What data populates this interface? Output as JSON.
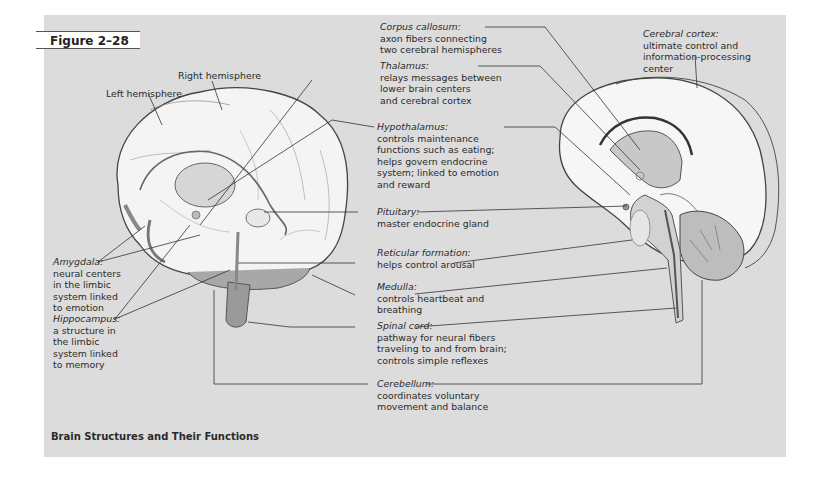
{
  "figure": {
    "label": "Figure 2–28",
    "caption": "Brain Structures and Their Functions",
    "background_color": "#dcdcdc"
  },
  "left_brain": {
    "labels": {
      "right_hemisphere": "Right hemisphere",
      "left_hemisphere": "Left hemisphere"
    },
    "amygdala": {
      "term": "Amygdala:",
      "desc": [
        "neural centers",
        "in the limbic",
        "system linked",
        "to emotion"
      ]
    },
    "hippocampus": {
      "term": "Hippocampus:",
      "desc": [
        "a structure in",
        "the limbic",
        "system linked",
        "to memory"
      ]
    }
  },
  "center_labels": [
    {
      "term": "Corpus callosum:",
      "desc": [
        "axon fibers connecting",
        "two cerebral hemispheres"
      ]
    },
    {
      "term": "Thalamus:",
      "desc": [
        "relays messages between",
        "lower brain centers",
        "and cerebral cortex"
      ]
    },
    {
      "term": "Hypothalamus:",
      "desc": [
        "controls maintenance",
        "functions such as eating;",
        "helps govern endocrine",
        "system; linked to emotion",
        "and reward"
      ]
    },
    {
      "term": "Pituitary:",
      "desc": [
        "master endocrine gland"
      ]
    },
    {
      "term": "Reticular formation:",
      "desc": [
        "helps control arousal"
      ]
    },
    {
      "term": "Medulla:",
      "desc": [
        "controls heartbeat and",
        "breathing"
      ]
    },
    {
      "term": "Spinal cord:",
      "desc": [
        "pathway for neural fibers",
        "traveling to and from brain;",
        "controls simple reflexes"
      ]
    },
    {
      "term": "Cerebellum:",
      "desc": [
        "coordinates voluntary",
        "movement and balance"
      ]
    }
  ],
  "right_brain": {
    "cerebral_cortex": {
      "term": "Cerebral cortex:",
      "desc": [
        "ultimate control and",
        "information-processing",
        "center"
      ]
    }
  }
}
